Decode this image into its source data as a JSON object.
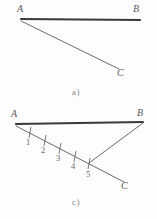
{
  "figure": {
    "stroke_color": "#4a4a4a",
    "thick_stroke_color": "#3a3a3a",
    "label_color": "#5b5b5b",
    "background": "#fdfdfd"
  },
  "panel_a": {
    "caption": "a)",
    "points": {
      "A": "A",
      "B": "B",
      "C": "C"
    },
    "geometry": {
      "A": [
        21,
        19
      ],
      "B": [
        140,
        20
      ],
      "C": [
        119,
        69
      ]
    },
    "segments": [
      {
        "name": "AB",
        "from": "A",
        "to": "B",
        "weight": "thick"
      },
      {
        "name": "AC",
        "from": "A",
        "to": "C",
        "weight": "thin"
      }
    ]
  },
  "panel_c": {
    "caption": "c)",
    "points": {
      "A": "A",
      "B": "B",
      "C": "C"
    },
    "geometry": {
      "A": [
        16,
        124
      ],
      "B": [
        143,
        122
      ],
      "C": [
        124,
        182
      ],
      "P5": [
        89,
        163
      ]
    },
    "segments": [
      {
        "name": "AB",
        "from": "A",
        "to": "B",
        "weight": "thick"
      },
      {
        "name": "AC",
        "from": "A",
        "to": "C",
        "weight": "thin"
      },
      {
        "name": "B5",
        "from": "B",
        "to": "P5",
        "weight": "thin"
      }
    ],
    "division_marks": [
      {
        "label": "1",
        "x": 30,
        "y": 133,
        "label_x": 25,
        "label_y": 139
      },
      {
        "label": "2",
        "x": 45,
        "y": 140,
        "label_x": 40,
        "label_y": 146
      },
      {
        "label": "3",
        "x": 60,
        "y": 147,
        "label_x": 55,
        "label_y": 153
      },
      {
        "label": "4",
        "x": 74,
        "y": 155,
        "label_x": 69,
        "label_y": 161
      },
      {
        "label": "5",
        "x": 89,
        "y": 163,
        "label_x": 85,
        "label_y": 172
      }
    ],
    "division_count": 5
  }
}
